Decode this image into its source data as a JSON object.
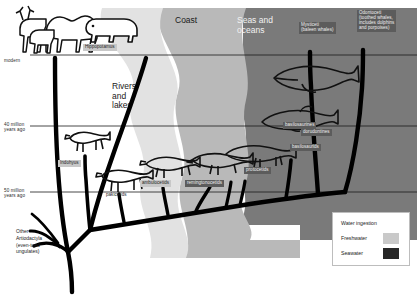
{
  "figure": {
    "background": "#ffffff"
  },
  "habitat_zones": [
    {
      "key": "rivers_lakes",
      "label": "Rivers\nand\nlakes",
      "color": "#ffffff",
      "text_on_dark": false
    },
    {
      "key": "transition",
      "label": "",
      "color": "#e2e2e2",
      "text_on_dark": false
    },
    {
      "key": "coast",
      "label": "Coast",
      "color": "#b9b9b9",
      "text_on_dark": false
    },
    {
      "key": "seas_oceans",
      "label": "Seas and\noceans",
      "color": "#7a7a7a",
      "text_on_dark": true
    }
  ],
  "time_axis": {
    "ticks": [
      {
        "label": "modern",
        "y": 62
      },
      {
        "label": "40 million\nyears ago",
        "y": 128
      },
      {
        "label": "50 million\nyears ago",
        "y": 193
      }
    ]
  },
  "taxa": [
    {
      "key": "hippopotamus",
      "label": "Hippopotamus",
      "style": "light"
    },
    {
      "key": "mysticeti",
      "label": "Mysticeti\n(baleen whales)",
      "style": "dark"
    },
    {
      "key": "odontoceti",
      "label": "Odontoceti\n(toothed whales,\nincludes dolphins\nand porpoises)",
      "style": "dark"
    },
    {
      "key": "basilosaurines",
      "label": "basilosaurines",
      "style": "dark"
    },
    {
      "key": "dorudontines",
      "label": "dorudontines",
      "style": "dark"
    },
    {
      "key": "basilosaurids",
      "label": "basilosaurids",
      "style": "dark"
    },
    {
      "key": "protocetids",
      "label": "protocetids",
      "style": "dark"
    },
    {
      "key": "remingtonocetids",
      "label": "remingtonocetids",
      "style": "dark"
    },
    {
      "key": "ambulocetids",
      "label": "ambulocetids",
      "style": "light"
    },
    {
      "key": "pakicetids",
      "label": "pakicetids",
      "style": "plain"
    },
    {
      "key": "indohyus",
      "label": "Indohyus",
      "style": "light"
    }
  ],
  "root_note": "Other\nArtiodactyla\n(even-toed\nungulates)",
  "modern_label": "modern",
  "legend": {
    "title": "Water ingestion",
    "items": [
      {
        "label": "Freshwater",
        "color": "#c9c9c9"
      },
      {
        "label": "Seawater",
        "color": "#272727"
      }
    ]
  }
}
